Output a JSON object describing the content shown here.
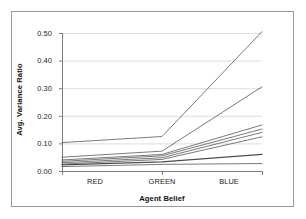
{
  "chart_data": {
    "type": "line",
    "title": "",
    "xlabel": "Agent Belief",
    "ylabel": "Avg. Variance Ratio",
    "categories": [
      "RED",
      "GREEN",
      "BLUE"
    ],
    "x_tick_labels": [
      "RED",
      "GREEN",
      "BLUE"
    ],
    "y_tick_labels": [
      "0.00",
      "0.10",
      "0.20",
      "0.30",
      "0.40",
      "0.50"
    ],
    "y_tick_values": [
      0.0,
      0.1,
      0.2,
      0.3,
      0.4,
      0.5
    ],
    "ylim": [
      0.0,
      0.5
    ],
    "grid": "horizontal",
    "legend": "none",
    "line_color": "#4d4d4d",
    "series": [
      {
        "name": "series-1",
        "values": [
          0.103,
          0.125,
          0.505
        ]
      },
      {
        "name": "series-2",
        "values": [
          0.05,
          0.072,
          0.305
        ]
      },
      {
        "name": "series-3",
        "values": [
          0.04,
          0.06,
          0.167
        ]
      },
      {
        "name": "series-4",
        "values": [
          0.035,
          0.055,
          0.152
        ]
      },
      {
        "name": "series-5",
        "values": [
          0.03,
          0.048,
          0.14
        ]
      },
      {
        "name": "series-6",
        "values": [
          0.025,
          0.042,
          0.124
        ]
      },
      {
        "name": "series-7",
        "values": [
          0.022,
          0.033,
          0.06
        ]
      },
      {
        "name": "series-8",
        "values": [
          0.016,
          0.024,
          0.027
        ]
      }
    ]
  }
}
